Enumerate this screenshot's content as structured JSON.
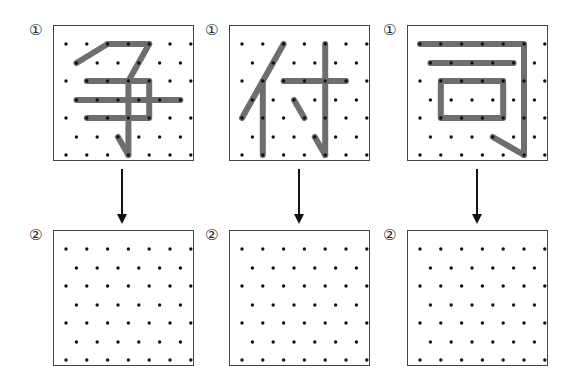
{
  "labels": {
    "step1": "①",
    "step2": "②"
  },
  "grid": {
    "rows": 7,
    "row_offsets": [
      18,
      37,
      55,
      74,
      92,
      111,
      129
    ],
    "col_half_step": 10.4,
    "col_start": 12,
    "odd_row_cols": [
      0,
      2,
      4,
      6,
      8,
      10,
      12
    ],
    "even_row_cols": [
      1,
      3,
      5,
      7,
      9,
      11
    ]
  },
  "colors": {
    "stroke": "#6e6e6e",
    "dot": "#111111",
    "border": "#444444"
  },
  "characters": [
    {
      "char": "争",
      "strokes": [
        [
          [
            4,
            0
          ],
          [
            8,
            0
          ]
        ],
        [
          [
            1,
            1
          ],
          [
            4,
            0
          ]
        ],
        [
          [
            8,
            0
          ],
          [
            6,
            2
          ]
        ],
        [
          [
            2,
            2
          ],
          [
            8,
            2
          ],
          [
            8,
            4
          ],
          [
            2,
            4
          ]
        ],
        [
          [
            1,
            3
          ],
          [
            11,
            3
          ]
        ],
        [
          [
            6,
            2
          ],
          [
            6,
            6
          ]
        ],
        [
          [
            5,
            5
          ],
          [
            6,
            6
          ]
        ]
      ]
    },
    {
      "char": "付",
      "strokes": [
        [
          [
            4,
            0
          ],
          [
            0,
            4
          ]
        ],
        [
          [
            2,
            2
          ],
          [
            2,
            6
          ]
        ],
        [
          [
            4,
            2
          ],
          [
            10,
            2
          ]
        ],
        [
          [
            8,
            0
          ],
          [
            8,
            6
          ]
        ],
        [
          [
            5,
            3
          ],
          [
            6,
            4
          ]
        ],
        [
          [
            7,
            5
          ],
          [
            8,
            6
          ]
        ]
      ]
    },
    {
      "char": "司",
      "strokes": [
        [
          [
            0,
            0
          ],
          [
            10,
            0
          ],
          [
            10,
            6
          ]
        ],
        [
          [
            1,
            1
          ],
          [
            9,
            1
          ]
        ],
        [
          [
            2,
            2
          ],
          [
            8,
            2
          ],
          [
            8,
            4
          ],
          [
            2,
            4
          ],
          [
            2,
            2
          ]
        ],
        [
          [
            7,
            5
          ],
          [
            10,
            6
          ]
        ]
      ]
    }
  ],
  "panels": [
    {
      "x": 53,
      "top_y": 25,
      "bottom_y": 230,
      "arrow_x": 122
    },
    {
      "x": 229,
      "top_y": 25,
      "bottom_y": 230,
      "arrow_x": 299
    },
    {
      "x": 407,
      "top_y": 25,
      "bottom_y": 230,
      "arrow_x": 477
    }
  ],
  "box_size": {
    "w": 141,
    "h": 136
  }
}
